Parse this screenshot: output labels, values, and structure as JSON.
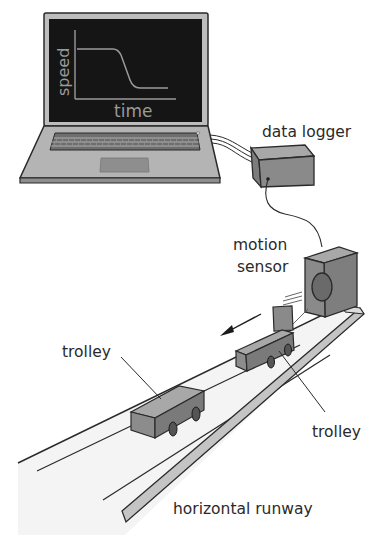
{
  "diagram": {
    "type": "experimental-setup",
    "labels": {
      "data_logger": "data logger",
      "motion_sensor_line1": "motion",
      "motion_sensor_line2": "sensor",
      "trolley_left": "trolley",
      "trolley_right": "trolley",
      "runway": "horizontal runway"
    },
    "screen_graph": {
      "ylabel": "speed",
      "xlabel": "time",
      "shape": "constant high speed, then decreasing, then constant low speed"
    },
    "components": [
      "laptop",
      "data logger",
      "motion sensor",
      "trolley",
      "trolley",
      "horizontal runway"
    ],
    "arrow_direction": "left (away from sensor)",
    "colors": {
      "screen": "#151515",
      "graph_line": "#9a9a9a",
      "laptop_body": "#b4b4b4",
      "box_face": "#8a8a8a",
      "box_top": "#a8a8a8",
      "outline": "#2a2a2a",
      "runway": "#f2f2f2"
    }
  }
}
